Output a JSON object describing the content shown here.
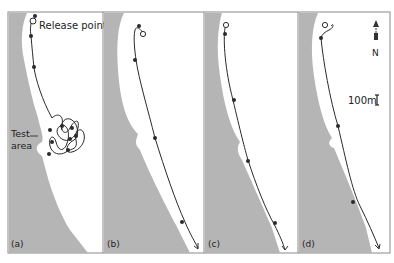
{
  "figure": {
    "land_color": "#b5b5b5",
    "water_color": "#ffffff",
    "track_color": "#2a2a2a",
    "border_color": "#8a8a8a",
    "panels": [
      {
        "id": "a",
        "label": "(a)",
        "annotations": {
          "release": "Release point",
          "test_line1": "Test",
          "test_line2": "area"
        }
      },
      {
        "id": "b",
        "label": "(b)"
      },
      {
        "id": "c",
        "label": "(c)"
      },
      {
        "id": "d",
        "label": "(d)"
      }
    ],
    "north_label": "N",
    "scale_label": "100m"
  }
}
